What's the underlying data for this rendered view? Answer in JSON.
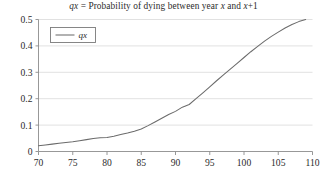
{
  "chart_data": {
    "type": "line",
    "title": "qx = Probability of dying between year x and x+1",
    "title_parts": {
      "symbol": "qx",
      "text_mid": " = Probability of dying between year ",
      "var1": "x",
      "text_and": " and ",
      "var2": "x",
      "tail": "+1"
    },
    "xlabel": "",
    "ylabel": "",
    "xlim": [
      70,
      110
    ],
    "ylim": [
      0,
      0.5
    ],
    "grid": "horizontal",
    "legend_position": "top-left",
    "series": [
      {
        "name": "qx",
        "color": "#6b6b6b",
        "x": [
          70,
          71,
          72,
          73,
          74,
          75,
          76,
          77,
          78,
          79,
          80,
          81,
          82,
          83,
          84,
          85,
          86,
          87,
          88,
          89,
          90,
          91,
          92,
          93,
          94,
          95,
          96,
          97,
          98,
          99,
          100,
          101,
          102,
          103,
          104,
          105,
          106,
          107,
          108,
          109
        ],
        "values": [
          0.022,
          0.025,
          0.028,
          0.031,
          0.034,
          0.037,
          0.041,
          0.045,
          0.049,
          0.052,
          0.053,
          0.058,
          0.064,
          0.07,
          0.077,
          0.085,
          0.098,
          0.112,
          0.126,
          0.14,
          0.152,
          0.168,
          0.178,
          0.2,
          0.222,
          0.245,
          0.268,
          0.29,
          0.312,
          0.334,
          0.356,
          0.378,
          0.398,
          0.418,
          0.436,
          0.452,
          0.468,
          0.481,
          0.492,
          0.5
        ]
      }
    ],
    "xticks": [
      70,
      75,
      80,
      85,
      90,
      95,
      100,
      105,
      110
    ],
    "xtick_labels": [
      "70",
      "75",
      "80",
      "85",
      "90",
      "95",
      "100",
      "105",
      "110"
    ],
    "yticks": [
      0,
      0.1,
      0.2,
      0.3,
      0.4,
      0.5
    ],
    "ytick_labels": [
      "0",
      "0.1",
      "0.2",
      "0.3",
      "0.4",
      "0.5"
    ],
    "legend_entries": [
      "qx"
    ],
    "colors": {
      "line": "#6b6b6b",
      "grid": "#d9d9d9",
      "axis": "#8c8c8c",
      "text": "#2b2b2b",
      "background": "#ffffff"
    }
  }
}
